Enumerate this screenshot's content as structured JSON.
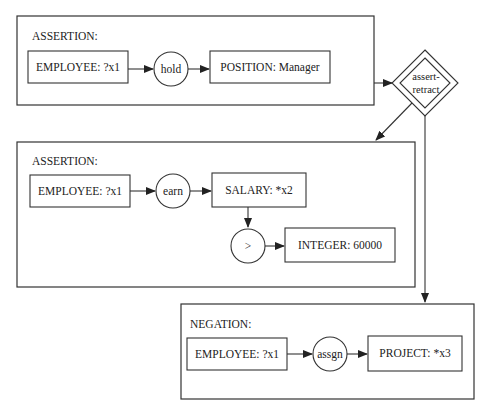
{
  "diagram": {
    "type": "conceptual-graph-rule",
    "blocks": [
      {
        "id": "assertion1",
        "title": "ASSERTION:",
        "nodes": [
          {
            "kind": "concept",
            "label": "EMPLOYEE: ?x1"
          },
          {
            "kind": "relation",
            "label": "hold"
          },
          {
            "kind": "concept",
            "label": "POSITION: Manager"
          }
        ]
      },
      {
        "id": "assertion2",
        "title": "ASSERTION:",
        "nodes": [
          {
            "kind": "concept",
            "label": "EMPLOYEE: ?x1"
          },
          {
            "kind": "relation",
            "label": "earn"
          },
          {
            "kind": "concept",
            "label": "SALARY: *x2"
          },
          {
            "kind": "relation",
            "label": ">"
          },
          {
            "kind": "concept",
            "label": "INTEGER: 60000"
          }
        ]
      },
      {
        "id": "negation",
        "title": "NEGATION:",
        "nodes": [
          {
            "kind": "concept",
            "label": "EMPLOYEE: ?x1"
          },
          {
            "kind": "relation",
            "label": "assgn"
          },
          {
            "kind": "concept",
            "label": "PROJECT: *x3"
          }
        ]
      }
    ],
    "operator": {
      "kind": "diamond",
      "label_line1": "assert-",
      "label_line2": "retract"
    },
    "edges": [
      {
        "from": "assertion1",
        "to": "operator"
      },
      {
        "from": "operator",
        "to": "assertion2"
      },
      {
        "from": "operator",
        "to": "negation"
      }
    ]
  }
}
